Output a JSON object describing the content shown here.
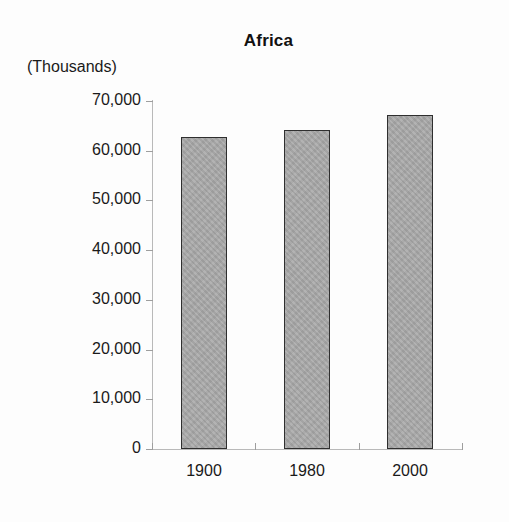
{
  "chart_data": {
    "type": "bar",
    "title": "Africa",
    "units_label": "(Thousands)",
    "xlabel": "",
    "ylabel": "",
    "categories": [
      "1900",
      "1980",
      "2000"
    ],
    "values": [
      62800,
      64200,
      67200
    ],
    "ylim": [
      0,
      70000
    ],
    "y_ticks": [
      0,
      10000,
      20000,
      30000,
      40000,
      50000,
      60000,
      70000
    ],
    "y_tick_labels": [
      "0",
      "10,000",
      "20,000",
      "30,000",
      "40,000",
      "50,000",
      "60,000",
      "70,000"
    ],
    "grid": false,
    "legend": null,
    "series": [
      {
        "name": "Population",
        "values": [
          62800,
          64200,
          67200
        ],
        "fill_color": "#a9a9a9",
        "border_color": "#2f2f2f"
      }
    ],
    "axis_color": "#b9b9b9",
    "background_color": "#fdfdfd",
    "text_color": "#1a1a1a"
  }
}
